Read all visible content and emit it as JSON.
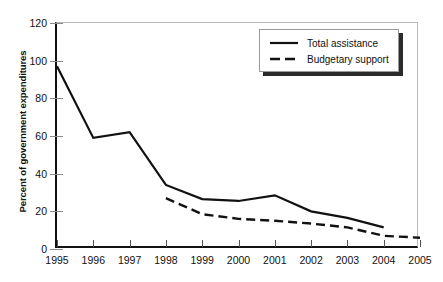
{
  "chart_data": {
    "type": "line",
    "title": "",
    "xlabel": "",
    "ylabel": "Percent of government expenditures",
    "x": [
      1995,
      1996,
      1997,
      1998,
      1999,
      2000,
      2001,
      2002,
      2003,
      2004,
      2005
    ],
    "xticklabels": [
      "1995",
      "1996",
      "1997",
      "1998",
      "1999",
      "2000",
      "2001",
      "2002",
      "2003",
      "2004",
      "2005"
    ],
    "yticklabels": [
      "0",
      "20",
      "40",
      "60",
      "80",
      "100",
      "120"
    ],
    "yticks": [
      0,
      20,
      40,
      60,
      80,
      100,
      120
    ],
    "ylim": [
      0,
      120
    ],
    "xlim": [
      1995,
      2005
    ],
    "grid": false,
    "legend_position": "top-right",
    "series": [
      {
        "name": "Total assistance",
        "style": "solid",
        "color": "#111111",
        "x": [
          1995,
          1996,
          1997,
          1998,
          1999,
          2000,
          2001,
          2002,
          2003,
          2004
        ],
        "values": [
          97,
          59,
          62,
          34,
          26.5,
          25.5,
          28.5,
          20,
          16.5,
          11.5
        ]
      },
      {
        "name": "Budgetary support",
        "style": "dashed",
        "color": "#111111",
        "x": [
          1998,
          1999,
          2000,
          2001,
          2002,
          2003,
          2004,
          2005
        ],
        "values": [
          27,
          18.5,
          16,
          15,
          13.5,
          11.5,
          7,
          6
        ]
      }
    ]
  },
  "legend": {
    "items": [
      {
        "label": "Total assistance",
        "style": "solid"
      },
      {
        "label": "Budgetary support",
        "style": "dashed"
      }
    ]
  }
}
